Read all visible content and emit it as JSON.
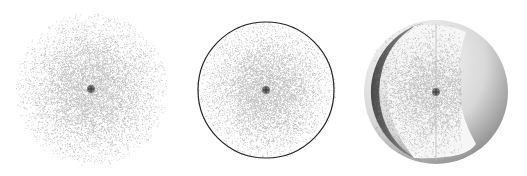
{
  "figure": {
    "panels": [
      {
        "id": "cloud",
        "description": "diffuse probability cloud",
        "center": [
          91,
          89
        ],
        "radius": 75
      },
      {
        "id": "cloud-boundary",
        "description": "probability cloud with boundary surface circle",
        "center": [
          266,
          90
        ],
        "radius": 68
      },
      {
        "id": "sphere-cutaway",
        "description": "3D sphere cutaway showing cloud inside",
        "center": [
          436,
          92
        ],
        "radius": 72
      }
    ],
    "colors": {
      "dot": "#8a8a8a",
      "nucleus": "#333333",
      "boundary": "#222222",
      "background": "#ffffff"
    }
  }
}
